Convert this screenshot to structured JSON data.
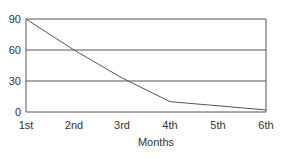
{
  "chart_data": {
    "type": "line",
    "title": "",
    "xlabel": "Months",
    "ylabel": "",
    "categories": [
      "1st",
      "2nd",
      "3rd",
      "4th",
      "5th",
      "6th"
    ],
    "series": [
      {
        "name": "Series 1",
        "values": [
          90,
          60,
          33,
          10,
          6,
          2
        ]
      }
    ],
    "yticks": [
      0,
      30,
      60,
      90
    ],
    "ylim": [
      0,
      90
    ],
    "grid": true,
    "legend": "none",
    "colors": {
      "line": "#555555",
      "grid": "#555555",
      "axis": "#555555"
    }
  }
}
